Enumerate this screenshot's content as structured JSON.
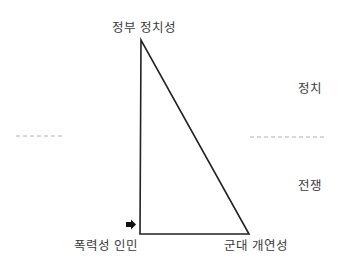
{
  "vertices": {
    "top": "정부  정치성",
    "bottom_left": "폭력성 인민",
    "bottom_right": "군대  개연성"
  },
  "side_labels": {
    "upper": "정치",
    "lower": "전쟁"
  },
  "icons": {
    "pointer": "arrow-right-icon"
  },
  "colors": {
    "line": "#222222",
    "dash": "#b0b0b0",
    "text": "#3a3a3a"
  }
}
